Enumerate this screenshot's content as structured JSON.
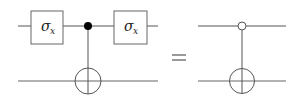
{
  "diagram": {
    "type": "quantum-circuit-identity",
    "colors": {
      "line": "#555555",
      "box_stroke": "#666666",
      "fill_dot": "#000000",
      "background": "#ffffff"
    },
    "left_circuit": {
      "gates": [
        {
          "label": "σ",
          "subscript": "x",
          "position": "before-control"
        },
        {
          "label": "σ",
          "subscript": "x",
          "position": "after-control"
        }
      ],
      "control": "filled",
      "target": "cnot-plus"
    },
    "equals": "=",
    "right_circuit": {
      "control": "open",
      "target": "cnot-plus"
    }
  }
}
